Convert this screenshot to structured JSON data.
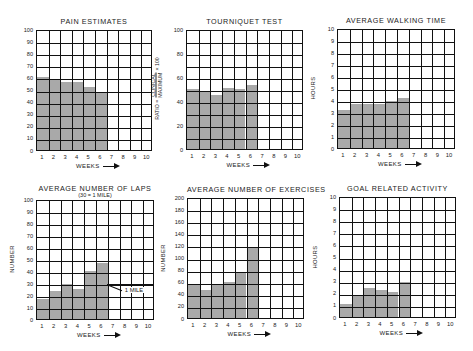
{
  "chart_data": [
    {
      "id": "pain",
      "type": "bar",
      "title": "PAIN ESTIMATES",
      "subtitle": "",
      "xlabel": "WEEKS",
      "ylabel": "",
      "categories": [
        "1",
        "2",
        "3",
        "4",
        "5",
        "6",
        "7",
        "8",
        "9",
        "10"
      ],
      "values": [
        60,
        58,
        56,
        56,
        52,
        47,
        null,
        null,
        null,
        null
      ],
      "ylim": [
        0,
        100
      ],
      "yticks": [
        "0",
        "10",
        "20",
        "30",
        "40",
        "50",
        "60",
        "70",
        "80",
        "90",
        "100"
      ],
      "grid": true,
      "box": {
        "x": 36,
        "y": 30,
        "w": 116,
        "h": 121
      }
    },
    {
      "id": "tourniquet",
      "type": "bar",
      "title": "TOURNIQUET TEST",
      "subtitle": "",
      "xlabel": "WEEKS",
      "ylabel": "RATIO = CLINICAL / MAXIMUM × 100",
      "ylabel_parts": {
        "prefix": "RATIO =",
        "numerator": "CLINICAL",
        "denominator": "MAXIMUM",
        "suffix": "× 100"
      },
      "categories": [
        "1",
        "2",
        "3",
        "4",
        "5",
        "6",
        "7",
        "8",
        "9",
        "10"
      ],
      "values": [
        50,
        48,
        45,
        51,
        50,
        53,
        null,
        null,
        null,
        null
      ],
      "ylim": [
        0,
        100
      ],
      "yticks": [
        "0",
        "",
        "20",
        "",
        "40",
        "",
        "60",
        "",
        "80",
        "",
        "100"
      ],
      "grid": true,
      "box": {
        "x": 186,
        "y": 30,
        "w": 117,
        "h": 120
      }
    },
    {
      "id": "walking",
      "type": "bar",
      "title": "AVERAGE WALKING TIME",
      "subtitle": "",
      "xlabel": "WEEKS",
      "ylabel": "HOURS",
      "categories": [
        "1",
        "2",
        "3",
        "4",
        "5",
        "6",
        "7",
        "8",
        "9",
        "10"
      ],
      "values": [
        3.2,
        3.7,
        3.7,
        3.7,
        3.9,
        4.2,
        null,
        null,
        null,
        null
      ],
      "ylim": [
        0,
        10
      ],
      "yticks": [
        "0",
        "1",
        "2",
        "3",
        "4",
        "5",
        "6",
        "7",
        "8",
        "9",
        "10"
      ],
      "grid": true,
      "box": {
        "x": 337,
        "y": 29,
        "w": 118,
        "h": 120
      }
    },
    {
      "id": "laps",
      "type": "bar",
      "title": "AVERAGE NUMBER OF LAPS",
      "subtitle": "(30 = 1 MILE)",
      "xlabel": "WEEKS",
      "ylabel": "NUMBER",
      "categories": [
        "1",
        "2",
        "3",
        "4",
        "5",
        "6",
        "7",
        "8",
        "9",
        "10"
      ],
      "values": [
        17,
        23,
        29,
        25,
        40,
        47,
        null,
        null,
        null,
        null
      ],
      "ylim": [
        0,
        100
      ],
      "yticks": [
        "0",
        "10",
        "20",
        "30",
        "40",
        "50",
        "60",
        "70",
        "80",
        "90",
        "100"
      ],
      "grid": true,
      "annotations": [
        {
          "text": "1 MILE",
          "y": 30
        }
      ],
      "box": {
        "x": 36,
        "y": 200,
        "w": 118,
        "h": 120
      }
    },
    {
      "id": "exercises",
      "type": "bar",
      "title": "AVERAGE NUMBER OF EXERCISES",
      "subtitle": "",
      "xlabel": "WEEKS",
      "ylabel": "NUMBER",
      "categories": [
        "1",
        "2",
        "3",
        "4",
        "5",
        "6",
        "7",
        "8",
        "9",
        "10"
      ],
      "values": [
        56,
        46,
        54,
        60,
        76,
        117,
        null,
        null,
        null,
        null
      ],
      "ylim": [
        0,
        200
      ],
      "yticks": [
        "0",
        "20",
        "40",
        "60",
        "80",
        "100",
        "120",
        "140",
        "160",
        "180",
        "200"
      ],
      "grid": true,
      "box": {
        "x": 187,
        "y": 198,
        "w": 117,
        "h": 121
      }
    },
    {
      "id": "goal",
      "type": "bar",
      "title": "GOAL RELATED ACTIVITY",
      "subtitle": "",
      "xlabel": "WEEKS",
      "ylabel": "HOURS",
      "categories": [
        "1",
        "2",
        "3",
        "4",
        "5",
        "6",
        "7",
        "8",
        "9",
        "10"
      ],
      "values": [
        1.1,
        1.8,
        2.4,
        2.2,
        2.1,
        2.9,
        null,
        null,
        null,
        null
      ],
      "ylim": [
        0,
        10
      ],
      "yticks": [
        "0",
        "1",
        "2",
        "3",
        "4",
        "5",
        "6",
        "7",
        "8",
        "9",
        "10"
      ],
      "grid": true,
      "box": {
        "x": 339,
        "y": 197,
        "w": 117,
        "h": 121
      }
    }
  ],
  "colors": {
    "bar": "#a9a9a9",
    "grid": "#111111",
    "background": "#ffffff"
  }
}
